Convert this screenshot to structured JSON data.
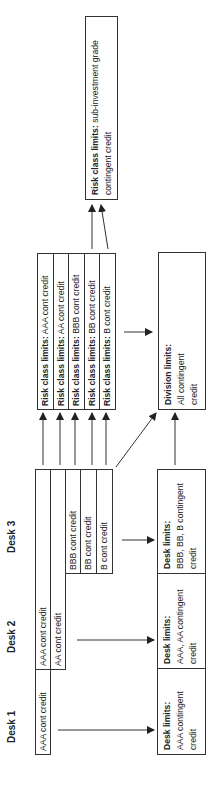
{
  "desks": {
    "labels": [
      "Desk 1",
      "Desk 2",
      "Desk 3"
    ]
  },
  "desk_bars": [
    "AAA cont credit",
    "AAA cont credit",
    "AA cont credit",
    "BBB cont credit",
    "BB cont credit",
    "B cont credit"
  ],
  "risk_class": {
    "prefix": "Risk class limits:",
    "rows": [
      "AAA cont credit",
      "AA cont credit",
      "BBB cont credit",
      "BB cont credit",
      "B cont credit"
    ]
  },
  "risk_subinvestment": {
    "prefix": "Risk class limits:",
    "text": "sub-investment grade contingent credit"
  },
  "division": {
    "title": "Division limits:",
    "text": "All contingent credit"
  },
  "desk_limits": [
    {
      "title": "Desk limits:",
      "text": "AAA contingent credit"
    },
    {
      "title": "Desk limits:",
      "text": "AAA, AA contingent credit"
    },
    {
      "title": "Desk limits:",
      "text": "BBB, BB, B contingent credit"
    }
  ],
  "colors": {
    "line": "#333333",
    "background": "#ffffff",
    "text": "#222222"
  }
}
